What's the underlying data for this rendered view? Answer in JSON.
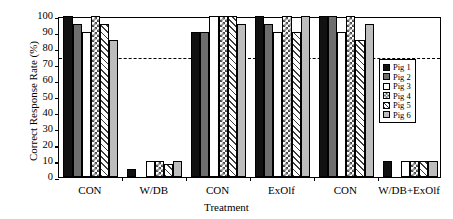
{
  "chart_data": {
    "type": "bar",
    "title": "",
    "xlabel": "Treatment",
    "ylabel": "Correct Response Rate (%)",
    "categories": [
      "CON",
      "W/DB",
      "CON",
      "ExOlf",
      "CON",
      "W/DB+ExOlf"
    ],
    "series": [
      {
        "name": "Pig 1",
        "values": [
          100,
          5,
          90,
          100,
          100,
          10
        ]
      },
      {
        "name": "Pig 2",
        "values": [
          95,
          0,
          90,
          95,
          100,
          0
        ]
      },
      {
        "name": "Pig 3",
        "values": [
          90,
          10,
          100,
          90,
          90,
          10
        ]
      },
      {
        "name": "Pig 4",
        "values": [
          100,
          10,
          100,
          100,
          100,
          10
        ]
      },
      {
        "name": "Pig 5",
        "values": [
          95,
          8,
          100,
          90,
          85,
          10
        ]
      },
      {
        "name": "Pig 6",
        "values": [
          85,
          10,
          95,
          100,
          95,
          10
        ]
      }
    ],
    "ylim": [
      0,
      100
    ],
    "yticks": [
      0,
      10,
      20,
      30,
      40,
      50,
      60,
      70,
      80,
      90,
      100
    ],
    "ytick_labels": [
      "0",
      "10",
      "20",
      "30",
      "40",
      "50",
      "60",
      "70",
      "80",
      "90",
      "100"
    ],
    "grid": false,
    "legend_position": "right-inside",
    "threshold_line": {
      "value": 75,
      "style": "dashed",
      "color": "#000000"
    },
    "colors": {
      "series": [
        "#111111",
        "#6e6e6e",
        "#ffffff",
        "#ffffff",
        "#ffffff",
        "#bdbdbd"
      ],
      "axis": "#000000",
      "background": "#ffffff"
    }
  }
}
